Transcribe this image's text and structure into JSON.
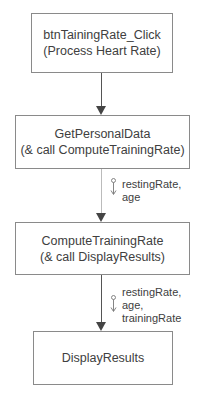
{
  "diagram": {
    "type": "structure-chart",
    "nodes": [
      {
        "id": "n1",
        "line1": "btnTainingRate_Click",
        "line2": "(Process Heart Rate)"
      },
      {
        "id": "n2",
        "line1": "GetPersonalData",
        "line2": "(& call ComputeTrainingRate)"
      },
      {
        "id": "n3",
        "line1": "ComputeTrainingRate",
        "line2": "(& call DisplayResults)"
      },
      {
        "id": "n4",
        "line1": "DisplayResults"
      }
    ],
    "edges": [
      {
        "from": "n1",
        "to": "n2",
        "params": []
      },
      {
        "from": "n2",
        "to": "n3",
        "params": [
          "restingRate,",
          "age"
        ]
      },
      {
        "from": "n3",
        "to": "n4",
        "params": [
          "restingRate,",
          "age,",
          "trainingRate"
        ]
      }
    ]
  }
}
